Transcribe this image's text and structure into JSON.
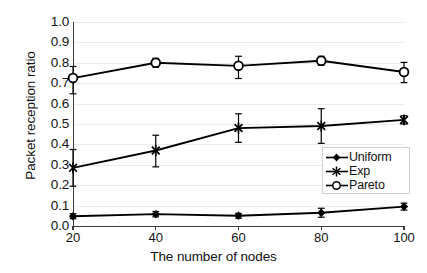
{
  "chart_data": {
    "type": "line",
    "title": "",
    "xlabel": "The number of nodes",
    "ylabel": "Packet reception ratio",
    "categories": [
      20,
      40,
      60,
      80,
      100
    ],
    "x_tick_labels": [
      "20",
      "40",
      "60",
      "80",
      "100"
    ],
    "y_tick_labels": [
      "0.0",
      "0.1",
      "0.2",
      "0.3",
      "0.4",
      "0.5",
      "0.6",
      "0.7",
      "0.8",
      "0.9",
      "1.0"
    ],
    "ylim": [
      0.0,
      1.0
    ],
    "xlim": [
      20,
      100
    ],
    "grid": "horizontal",
    "legend_position": "lower-right-inside",
    "series": [
      {
        "name": "Uniform",
        "marker": "filled-diamond",
        "color": "#000000",
        "values": [
          0.048,
          0.058,
          0.05,
          0.065,
          0.095
        ],
        "err_low": [
          0.012,
          0.013,
          0.012,
          0.022,
          0.017
        ],
        "err_high": [
          0.012,
          0.013,
          0.012,
          0.022,
          0.017
        ]
      },
      {
        "name": "Exp",
        "marker": "asterisk",
        "color": "#000000",
        "values": [
          0.285,
          0.37,
          0.48,
          0.49,
          0.52
        ],
        "err_low": [
          0.09,
          0.08,
          0.07,
          0.085,
          0.02
        ],
        "err_high": [
          0.09,
          0.075,
          0.07,
          0.085,
          0.02
        ]
      },
      {
        "name": "Pareto",
        "marker": "open-circle",
        "color": "#000000",
        "values": [
          0.725,
          0.8,
          0.785,
          0.81,
          0.755
        ],
        "err_low": [
          0.077,
          0.022,
          0.062,
          0.022,
          0.052
        ],
        "err_high": [
          0.057,
          0.022,
          0.047,
          0.022,
          0.047
        ]
      }
    ]
  },
  "legend": {
    "items": [
      {
        "label": "Uniform",
        "marker": "filled-diamond"
      },
      {
        "label": "Exp",
        "marker": "asterisk"
      },
      {
        "label": "Pareto",
        "marker": "open-circle"
      }
    ]
  }
}
